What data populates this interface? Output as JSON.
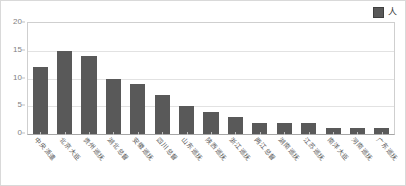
{
  "chart_data": {
    "type": "bar",
    "title": "",
    "xlabel": "",
    "ylabel": "",
    "ylim": [
      0,
      20
    ],
    "yticks": [
      0,
      5,
      10,
      15,
      20
    ],
    "grid": true,
    "legend_position": "top-right",
    "legend": [
      "人"
    ],
    "series_color": "#595959",
    "categories": [
      "中央派遣",
      "北京大臣",
      "贵州巡抚",
      "湖北总督",
      "安徽巡抚",
      "四川总督",
      "山东巡抚",
      "陕西巡抚",
      "浙江巡抚",
      "两江总督",
      "湖南巡抚",
      "江苏巡抚",
      "南洋大臣",
      "河南巡抚",
      "广东巡抚"
    ],
    "series": [
      {
        "name": "人",
        "values": [
          12,
          15,
          14,
          10,
          9,
          7,
          5,
          4,
          3,
          2,
          2,
          2,
          1,
          1,
          1
        ]
      }
    ]
  },
  "colors": {
    "bar": "#595959",
    "legend_swatch": "#595959",
    "gridline": "#e2e2e2",
    "axis": "#a6a6a6",
    "tick_text": "#7f7f7f",
    "label_text": "#595959",
    "figure_border": "#d9d9d9",
    "background": "#ffffff"
  }
}
